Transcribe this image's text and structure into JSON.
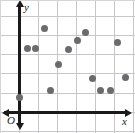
{
  "chart_data": {
    "type": "scatter",
    "title": "",
    "xlabel": "x",
    "ylabel": "y",
    "grid": true,
    "legend": null,
    "xlim": [
      -1,
      6
    ],
    "ylim": [
      -1,
      6
    ],
    "x_tick_labels": [],
    "y_tick_labels": [],
    "origin_label": "O",
    "gridline_spacing": 1,
    "point_count": 14,
    "point_color": "#6b6b6f",
    "axis_color": "#1a1a1a",
    "grid_color": "#c8c6cc",
    "background_color": "#ffffff",
    "points": [
      {
        "x": 0.0,
        "y": 0.8
      },
      {
        "x": 0.45,
        "y": 3.35
      },
      {
        "x": 0.85,
        "y": 3.35
      },
      {
        "x": 1.3,
        "y": 4.4
      },
      {
        "x": 1.6,
        "y": 1.15
      },
      {
        "x": 2.05,
        "y": 2.5
      },
      {
        "x": 2.55,
        "y": 3.3
      },
      {
        "x": 3.05,
        "y": 3.75
      },
      {
        "x": 3.45,
        "y": 4.2
      },
      {
        "x": 3.8,
        "y": 1.75
      },
      {
        "x": 4.25,
        "y": 1.15
      },
      {
        "x": 4.75,
        "y": 1.15
      },
      {
        "x": 5.15,
        "y": 3.65
      },
      {
        "x": 5.55,
        "y": 1.8
      }
    ],
    "pixel_points": [
      {
        "cx": 19,
        "cy": 97
      },
      {
        "cx": 27,
        "cy": 48
      },
      {
        "cx": 35,
        "cy": 48
      },
      {
        "cx": 44,
        "cy": 28
      },
      {
        "cx": 50,
        "cy": 90
      },
      {
        "cx": 58,
        "cy": 64
      },
      {
        "cx": 68,
        "cy": 49
      },
      {
        "cx": 77,
        "cy": 40
      },
      {
        "cx": 85,
        "cy": 32
      },
      {
        "cx": 92,
        "cy": 78
      },
      {
        "cx": 100,
        "cy": 90
      },
      {
        "cx": 110,
        "cy": 90
      },
      {
        "cx": 117,
        "cy": 42
      },
      {
        "cx": 125,
        "cy": 77
      }
    ],
    "gridlines_v_px": [
      0,
      19,
      38,
      57,
      76,
      95,
      114,
      133
    ],
    "gridlines_h_px": [
      0,
      16,
      35,
      54,
      73,
      93,
      112,
      131
    ],
    "axis_y_px": 19,
    "axis_x_px": 112
  }
}
